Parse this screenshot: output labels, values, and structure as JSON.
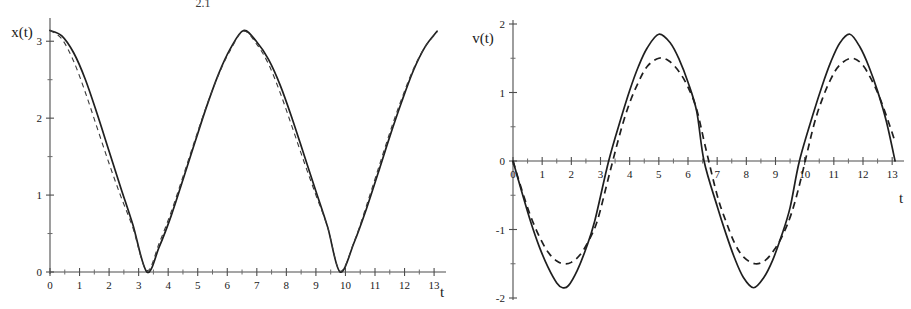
{
  "figure": {
    "caption_top_clipped": "2.1",
    "background": "#ffffff",
    "ink_color": "#1f1f1f"
  },
  "chart_data": [
    {
      "type": "line",
      "panel": "left",
      "title": "",
      "xlabel": "t",
      "ylabel": "x(t)",
      "xlim": [
        0,
        13.2
      ],
      "ylim": [
        0,
        3.25
      ],
      "grid": false,
      "legend": "none",
      "xticks": [
        0,
        1,
        2,
        3,
        4,
        5,
        6,
        7,
        8,
        9,
        10,
        11,
        12,
        13
      ],
      "xtick_labels": [
        "0",
        "1",
        "2",
        "3",
        "4",
        "5",
        "6",
        "7",
        "8",
        "9",
        "10",
        "11",
        "12",
        "13"
      ],
      "xminor_step": 0.5,
      "yticks": [
        0,
        1,
        2,
        3
      ],
      "ytick_labels": [
        "0",
        "1",
        "2",
        "3"
      ],
      "yminor_step": 0.5,
      "series": [
        {
          "name": "exact",
          "style": "solid",
          "amplitude": 3.1416,
          "period": 6.55,
          "mean": 1.5708,
          "phase_deg": 0,
          "description": "exact nonlinear pendulum angle, starts at maximum 3.14 at t=0, reaches 0 at t=3.28 and t=9.82",
          "x": [
            0.0,
            0.4,
            0.8,
            1.2,
            1.6,
            2.0,
            2.4,
            2.8,
            3.28,
            3.7,
            4.1,
            4.5,
            4.9,
            5.3,
            5.7,
            6.1,
            6.55,
            7.0,
            7.4,
            7.8,
            8.2,
            8.6,
            9.0,
            9.4,
            9.82,
            10.3,
            10.7,
            11.1,
            11.5,
            11.9,
            12.3,
            12.7,
            13.1
          ],
          "y": [
            3.14,
            3.07,
            2.85,
            2.5,
            2.05,
            1.57,
            1.09,
            0.62,
            0.0,
            0.33,
            0.73,
            1.2,
            1.68,
            2.15,
            2.57,
            2.9,
            3.14,
            2.99,
            2.76,
            2.42,
            1.99,
            1.52,
            1.05,
            0.58,
            0.0,
            0.39,
            0.81,
            1.28,
            1.76,
            2.21,
            2.62,
            2.93,
            3.13
          ]
        },
        {
          "name": "approximation",
          "style": "dashed",
          "amplitude": 3.1416,
          "period": 6.55,
          "mean": 1.5708,
          "description": "harmonic (small-angle) approximation, nearly coincident with exact curve",
          "x": [
            0.0,
            0.4,
            0.8,
            1.2,
            1.6,
            2.0,
            2.4,
            2.8,
            3.275,
            3.7,
            4.1,
            4.5,
            4.9,
            5.3,
            5.7,
            6.1,
            6.55,
            7.0,
            7.4,
            7.8,
            8.2,
            8.6,
            9.0,
            9.4,
            9.82,
            10.3,
            10.7,
            11.1,
            11.5,
            11.9,
            12.3,
            12.7,
            13.1
          ],
          "y": [
            3.14,
            3.03,
            2.74,
            2.33,
            1.87,
            1.41,
            0.98,
            0.58,
            0.02,
            0.38,
            0.78,
            1.24,
            1.71,
            2.16,
            2.56,
            2.88,
            3.13,
            2.96,
            2.7,
            2.32,
            1.88,
            1.43,
            1.0,
            0.58,
            0.01,
            0.4,
            0.85,
            1.33,
            1.81,
            2.25,
            2.64,
            2.93,
            3.12
          ]
        }
      ]
    },
    {
      "type": "line",
      "panel": "right",
      "title": "",
      "xlabel": "t",
      "ylabel": "v(t)",
      "xlim": [
        0,
        13.2
      ],
      "ylim": [
        -2,
        2
      ],
      "grid": false,
      "legend": "none",
      "xticks": [
        0,
        1,
        2,
        3,
        4,
        5,
        6,
        7,
        8,
        9,
        10,
        11,
        12,
        13
      ],
      "xtick_labels": [
        "0",
        "1",
        "2",
        "3",
        "4",
        "5",
        "6",
        "7",
        "8",
        "9",
        "10",
        "11",
        "12",
        "13"
      ],
      "xminor_step": 0.5,
      "yticks": [
        -2,
        -1,
        0,
        1,
        2
      ],
      "ytick_labels": [
        "-2",
        "-1",
        "0",
        "1",
        "2"
      ],
      "yminor_step": 0.5,
      "series": [
        {
          "name": "exact",
          "style": "solid",
          "peak": 1.85,
          "trough": -1.85,
          "period": 6.55,
          "description": "exact pendulum angular velocity; sharp rounded peaks at +1.85 (t=5.0, 11.55) and -1.85 (t=1.7, 8.25); zero at t=0, 3.28, 6.55, 9.82, 13.1",
          "x": [
            0.0,
            0.3,
            0.6,
            0.9,
            1.2,
            1.5,
            1.7,
            1.9,
            2.2,
            2.5,
            2.8,
            3.28,
            3.7,
            4.0,
            4.3,
            4.6,
            5.0,
            5.4,
            5.7,
            6.0,
            6.3,
            6.55,
            7.0,
            7.3,
            7.6,
            7.9,
            8.25,
            8.6,
            8.9,
            9.2,
            9.5,
            9.82,
            10.3,
            10.6,
            10.9,
            11.2,
            11.55,
            11.9,
            12.2,
            12.5,
            12.8,
            13.1
          ],
          "y": [
            0.0,
            -0.45,
            -0.88,
            -1.25,
            -1.55,
            -1.78,
            -1.85,
            -1.82,
            -1.6,
            -1.28,
            -0.88,
            0.0,
            0.62,
            1.03,
            1.38,
            1.65,
            1.85,
            1.72,
            1.48,
            1.15,
            0.72,
            0.0,
            -0.66,
            -1.06,
            -1.42,
            -1.7,
            -1.85,
            -1.7,
            -1.45,
            -1.1,
            -0.68,
            0.0,
            0.7,
            1.1,
            1.45,
            1.72,
            1.85,
            1.66,
            1.38,
            1.02,
            0.58,
            0.0
          ]
        },
        {
          "name": "approximation",
          "style": "dashed",
          "peak": 1.5,
          "trough": -1.5,
          "period": 6.55,
          "description": "harmonic approximation velocity; flatter rounded peaks at +-1.5, crosses zero near the same instants",
          "x": [
            0.0,
            0.3,
            0.6,
            0.9,
            1.2,
            1.5,
            1.75,
            2.0,
            2.3,
            2.6,
            2.9,
            3.3,
            3.7,
            4.0,
            4.3,
            4.6,
            5.0,
            5.35,
            5.7,
            6.0,
            6.3,
            6.6,
            7.0,
            7.3,
            7.6,
            7.9,
            8.3,
            8.65,
            8.95,
            9.25,
            9.55,
            9.85,
            10.3,
            10.6,
            10.9,
            11.2,
            11.6,
            11.95,
            12.25,
            12.55,
            12.85,
            13.1
          ],
          "y": [
            0.0,
            -0.42,
            -0.8,
            -1.1,
            -1.33,
            -1.46,
            -1.5,
            -1.48,
            -1.37,
            -1.16,
            -0.86,
            -0.2,
            0.45,
            0.85,
            1.15,
            1.38,
            1.5,
            1.46,
            1.3,
            1.08,
            0.75,
            0.2,
            -0.5,
            -0.88,
            -1.2,
            -1.4,
            -1.5,
            -1.45,
            -1.3,
            -1.08,
            -0.76,
            -0.3,
            0.5,
            0.9,
            1.2,
            1.4,
            1.5,
            1.42,
            1.22,
            0.95,
            0.6,
            0.28
          ]
        }
      ]
    }
  ],
  "panels": {
    "left": {
      "y_axis_name": "x(t)",
      "x_axis_name": "t",
      "y_tick_labels": [
        "0",
        "1",
        "2",
        "3"
      ],
      "x_tick_labels": [
        "0",
        "1",
        "2",
        "3",
        "4",
        "5",
        "6",
        "7",
        "8",
        "9",
        "10",
        "11",
        "12",
        "13"
      ]
    },
    "right": {
      "y_axis_name": "v(t)",
      "x_axis_name": "t",
      "y_tick_labels": [
        "-2",
        "-1",
        "0",
        "1",
        "2"
      ],
      "x_tick_labels": [
        "0",
        "1",
        "2",
        "3",
        "4",
        "5",
        "6",
        "7",
        "8",
        "9",
        "10",
        "11",
        "12",
        "13"
      ]
    }
  }
}
